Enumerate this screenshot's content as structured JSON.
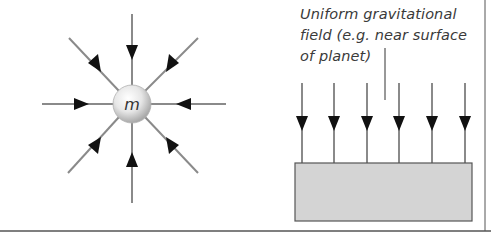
{
  "left_panel": {
    "mass_label": "m",
    "field_type": "radial",
    "arrow_count": 8,
    "arrow_direction": "inward"
  },
  "right_panel": {
    "caption_lines": [
      "Uniform gravitational",
      "field (e.g. near surface",
      "of planet)"
    ],
    "field_type": "uniform",
    "arrow_count": 6,
    "arrow_direction": "down",
    "surface_label": "planet surface"
  },
  "colors": {
    "line": "#8a8a8a",
    "arrowhead": "#111111",
    "surface_fill": "#d4d4d4",
    "surface_stroke": "#555555",
    "text": "#3a3a3a",
    "border": "#555555"
  }
}
